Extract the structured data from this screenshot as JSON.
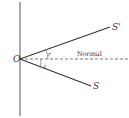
{
  "diagram": {
    "type": "reflection",
    "labels": {
      "origin": "O",
      "reflected_ray": "S'",
      "incident_ray": "S",
      "normal": "Normal",
      "reflection_angle": "r",
      "incidence_angle": "i"
    },
    "colors": {
      "line": "#333333",
      "background": "#ffffff"
    }
  }
}
